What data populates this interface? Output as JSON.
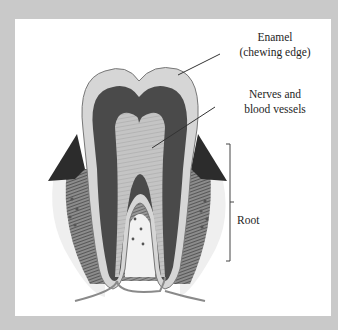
{
  "diagram": {
    "labels": {
      "enamel": {
        "line1": "Enamel",
        "line2": "(chewing edge)"
      },
      "nerves": {
        "line1": "Nerves and",
        "line2": "blood vessels"
      },
      "root": "Root"
    },
    "colors": {
      "background": "#c9c9c9",
      "panel": "#ffffff",
      "enamel": "#d8d8d8",
      "dentin_dark": "#4a4a4a",
      "pulp": "#bdbdbd",
      "gum": "#2c2c2c",
      "bone": "#9a9a9a",
      "text": "#1e1e1e"
    }
  }
}
